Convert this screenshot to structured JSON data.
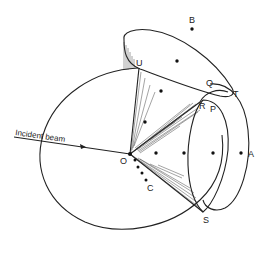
{
  "figure": {
    "beam_label": "Incident beam",
    "labels": {
      "O": "O",
      "A": "A",
      "B": "B",
      "C": "C",
      "P": "P",
      "Q": "Q",
      "R": "R",
      "S": "S",
      "T": "T",
      "U": "U"
    },
    "colors": {
      "line": "#222222",
      "background": "#ffffff"
    }
  }
}
